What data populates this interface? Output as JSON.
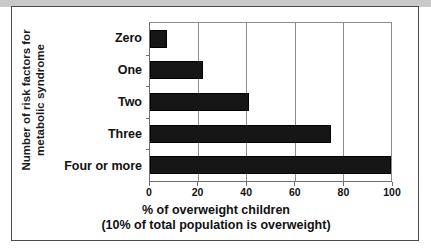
{
  "chart_data": {
    "type": "bar",
    "orientation": "horizontal",
    "title": "",
    "categories": [
      "Zero",
      "One",
      "Two",
      "Three",
      "Four or more"
    ],
    "values": [
      7,
      22,
      41,
      75,
      100
    ],
    "series": [
      {
        "name": "% of overweight children",
        "values": [
          7,
          22,
          41,
          75,
          100
        ]
      }
    ],
    "xlabel": "% of overweight children",
    "xlabel_line2": "(10% of total population is overweight)",
    "ylabel": "Number of risk factors for",
    "ylabel_line2": "metabolic syndrome",
    "xlim": [
      0,
      100
    ],
    "xticks": [
      0,
      20,
      40,
      60,
      80,
      100
    ],
    "xtick_labels": [
      "0",
      "20",
      "40",
      "60",
      "80",
      "100"
    ],
    "grid": true,
    "grid_axis": "x",
    "legend": false,
    "colors": {
      "bar": "#161616",
      "gridline": "#8c8c8c",
      "axis": "#6e6e6e",
      "frame": "#4a4a4a",
      "top_band": "#c9c9c9",
      "text": "#111111",
      "background": "#ffffff"
    }
  }
}
